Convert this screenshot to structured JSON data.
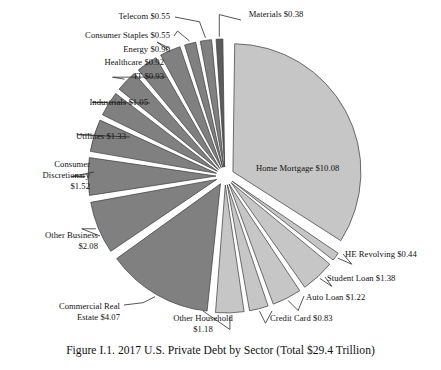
{
  "figure": {
    "caption": "Figure I.1. 2017 U.S. Private Debt by Sector (Total $29.4 Trillion)",
    "total_label": "Total $29.4 Trillion",
    "background": "#ffffff"
  },
  "colors": {
    "household_slice": "#c6c6c6",
    "business_slice": "#808080",
    "materials_slice": "#5c5c5c",
    "slice_outline": "#3a3a3a",
    "leader_line": "#2b2b2b",
    "text": "#111111"
  },
  "chart_data": {
    "type": "pie",
    "title": "Figure I.1. 2017 U.S. Private Debt by Sector (Total $29.4 Trillion)",
    "units": "trillions of USD",
    "total": 29.4,
    "legend": "none",
    "grid": false,
    "categories": [
      "Home Mortgage",
      "HE Revolving",
      "Student Loan",
      "Auto Loan",
      "Credit Card",
      "Other Household",
      "Commercial Real Estate",
      "Other Business",
      "Consumer Discretionary",
      "Utilities",
      "Industrials",
      "IT",
      "Healthcare",
      "Energy",
      "Consumer Staples",
      "Telecom",
      "Materials"
    ],
    "values": [
      10.08,
      0.44,
      1.38,
      1.22,
      0.83,
      1.18,
      4.07,
      2.08,
      1.52,
      1.33,
      1.05,
      0.93,
      0.92,
      0.9,
      0.55,
      0.55,
      0.38
    ],
    "slices": [
      {
        "name": "Home Mortgage",
        "label": "Home Mortgage $10.08",
        "value": 10.08,
        "group": "household",
        "color": "#c6c6c6"
      },
      {
        "name": "HE Revolving",
        "label": "HE Revolving $0.44",
        "value": 0.44,
        "group": "household",
        "color": "#c6c6c6"
      },
      {
        "name": "Student Loan",
        "label": "Student Loan $1.38",
        "value": 1.38,
        "group": "household",
        "color": "#c6c6c6"
      },
      {
        "name": "Auto Loan",
        "label": "Auto Loan $1.22",
        "value": 1.22,
        "group": "household",
        "color": "#c6c6c6"
      },
      {
        "name": "Credit Card",
        "label": "Credit Card $0.83",
        "value": 0.83,
        "group": "household",
        "color": "#c6c6c6"
      },
      {
        "name": "Other Household",
        "label": "Other Household\n$1.18",
        "value": 1.18,
        "group": "household",
        "color": "#c6c6c6"
      },
      {
        "name": "Commercial Real Estate",
        "label": "Commercial Real\nEstate $4.07",
        "value": 4.07,
        "group": "business",
        "color": "#808080"
      },
      {
        "name": "Other Business",
        "label": "Other Business\n$2.08",
        "value": 2.08,
        "group": "business",
        "color": "#808080"
      },
      {
        "name": "Consumer Discretionary",
        "label": "Consumer\nDiscretionary\n$1.52",
        "value": 1.52,
        "group": "business",
        "color": "#808080"
      },
      {
        "name": "Utilities",
        "label": "Utilities $1.33",
        "value": 1.33,
        "group": "business",
        "color": "#808080"
      },
      {
        "name": "Industrials",
        "label": "Industrials $1.05",
        "value": 1.05,
        "group": "business",
        "color": "#808080"
      },
      {
        "name": "IT",
        "label": "IT $0.93",
        "value": 0.93,
        "group": "business",
        "color": "#808080"
      },
      {
        "name": "Healthcare",
        "label": "Healthcare $0.92",
        "value": 0.92,
        "group": "business",
        "color": "#808080"
      },
      {
        "name": "Energy",
        "label": "Energy $0.90",
        "value": 0.9,
        "group": "business",
        "color": "#808080"
      },
      {
        "name": "Consumer Staples",
        "label": "Consumer Staples $0.55",
        "value": 0.55,
        "group": "business",
        "color": "#808080"
      },
      {
        "name": "Telecom",
        "label": "Telecom $0.55",
        "value": 0.55,
        "group": "business",
        "color": "#808080"
      },
      {
        "name": "Materials",
        "label": "Materials $0.38",
        "value": 0.38,
        "group": "business",
        "color": "#5c5c5c"
      }
    ]
  },
  "labels": {
    "home_mortgage": "Home Mortgage $10.08",
    "he_revolving": "HE Revolving $0.44",
    "student_loan": "Student Loan $1.38",
    "auto_loan": "Auto Loan $1.22",
    "credit_card": "Credit Card $0.83",
    "other_household_line1": "Other Household",
    "other_household_line2": "$1.18",
    "commercial_real_line1": "Commercial Real",
    "commercial_real_line2": "Estate $4.07",
    "other_business_line1": "Other Business",
    "other_business_line2": "$2.08",
    "consumer_disc_line1": "Consumer",
    "consumer_disc_line2": "Discretionary",
    "consumer_disc_line3": "$1.52",
    "utilities": "Utilities $1.33",
    "industrials": "Industrials $1.05",
    "it": "IT $0.93",
    "healthcare": "Healthcare $0.92",
    "energy": "Energy $0.90",
    "consumer_staples": "Consumer Staples $0.55",
    "telecom": "Telecom $0.55",
    "materials": "Materials $0.38"
  }
}
